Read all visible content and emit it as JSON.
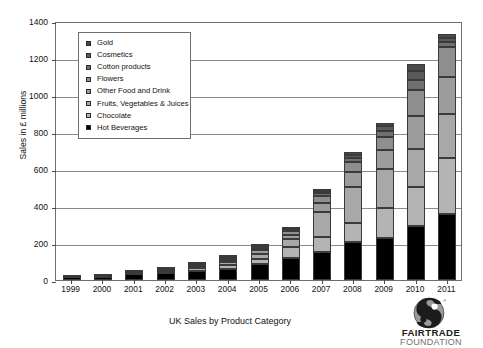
{
  "chart_data": {
    "type": "bar",
    "subtype": "stacked-bar",
    "title": "UK Sales by Product Category",
    "xlabel": "",
    "ylabel": "Sales in £ millions",
    "ylim": [
      0,
      1400
    ],
    "ytick_step": 200,
    "yticks": [
      0,
      200,
      400,
      600,
      800,
      1000,
      1200,
      1400
    ],
    "ytick_labels": [
      "0",
      "200",
      "400",
      "600",
      "800",
      "1000",
      "1200",
      "1400"
    ],
    "grid": true,
    "legend_position": "upper-left-inside",
    "categories": [
      "1999",
      "2000",
      "2001",
      "2002",
      "2003",
      "2004",
      "2005",
      "2006",
      "2007",
      "2008",
      "2009",
      "2010",
      "2011"
    ],
    "series": [
      {
        "name": "Hot Beverages",
        "color": "#000000",
        "values": [
          15,
          18,
          30,
          38,
          50,
          60,
          85,
          120,
          150,
          205,
          228,
          290,
          357
        ]
      },
      {
        "name": "Chocolate",
        "color": "#b4b4b4",
        "values": [
          1,
          2,
          6,
          8,
          13,
          20,
          30,
          56,
          80,
          105,
          160,
          215,
          300
        ]
      },
      {
        "name": "Fruits, Vegetables & Juices",
        "color": "#a8a8a8",
        "values": [
          1,
          1,
          4,
          6,
          10,
          18,
          28,
          45,
          140,
          195,
          210,
          205,
          240
        ]
      },
      {
        "name": "Other Food and Drink",
        "color": "#9c9c9c",
        "values": [
          1,
          1,
          3,
          4,
          7,
          12,
          18,
          25,
          45,
          78,
          105,
          175,
          200
        ]
      },
      {
        "name": "Flowers",
        "color": "#8e8e8e",
        "values": [
          1,
          1,
          2,
          3,
          5,
          9,
          14,
          20,
          38,
          55,
          72,
          140,
          160
        ]
      },
      {
        "name": "Cotton products",
        "color": "#707070",
        "values": [
          0,
          1,
          1,
          2,
          3,
          5,
          7,
          12,
          18,
          22,
          28,
          55,
          28
        ]
      },
      {
        "name": "Cosmetics",
        "color": "#5a5a5a",
        "values": [
          0,
          0,
          1,
          1,
          2,
          3,
          4,
          6,
          10,
          14,
          30,
          50,
          25
        ]
      },
      {
        "name": "Gold",
        "color": "#4a4a4a",
        "values": [
          0,
          0,
          0,
          0,
          0,
          0,
          0,
          0,
          9,
          16,
          17,
          40,
          20
        ]
      }
    ],
    "totals": [
      19,
      24,
      47,
      62,
      90,
      127,
      186,
      284,
      490,
      690,
      850,
      1170,
      1330
    ]
  },
  "legend": {
    "items": [
      {
        "label": "Gold",
        "color": "#4a4a4a"
      },
      {
        "label": "Cosmetics",
        "color": "#5a5a5a"
      },
      {
        "label": "Cotton products",
        "color": "#707070"
      },
      {
        "label": "Flowers",
        "color": "#8e8e8e"
      },
      {
        "label": "Other Food and Drink",
        "color": "#9c9c9c"
      },
      {
        "label": "Fruits, Vegetables & Juices",
        "color": "#a8a8a8"
      },
      {
        "label": "Chocolate",
        "color": "#b4b4b4"
      },
      {
        "label": "Hot Beverages",
        "color": "#000000"
      }
    ]
  },
  "logo": {
    "line1": "FAIRTRADE",
    "line2": "FOUNDATION",
    "mark_name": "fairtrade-mark-icon"
  }
}
